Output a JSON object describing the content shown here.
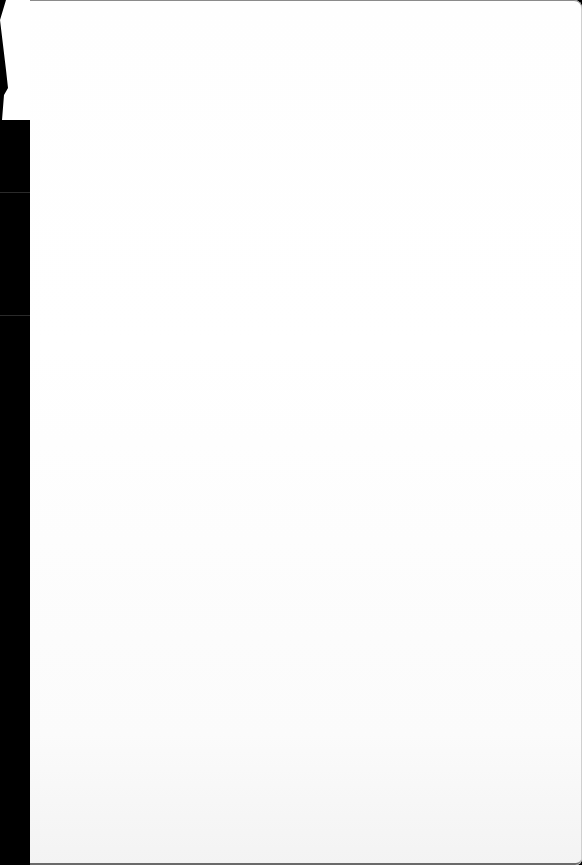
{
  "document": {
    "type": "scanned-page",
    "content": "",
    "blank": true
  },
  "colors": {
    "background": "#000000",
    "page": "#ffffff",
    "page_bottom_tint": "#f3f3f3"
  }
}
